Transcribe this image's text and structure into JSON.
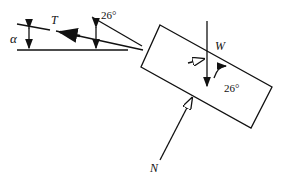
{
  "diagram": {
    "type": "free-body diagram",
    "labels": {
      "alpha": "α",
      "tension": "T",
      "angle_top": "26°",
      "weight": "W",
      "angle_weight": "26°",
      "normal": "N"
    },
    "colors": {
      "stroke": "#111111",
      "background": "#ffffff"
    }
  }
}
